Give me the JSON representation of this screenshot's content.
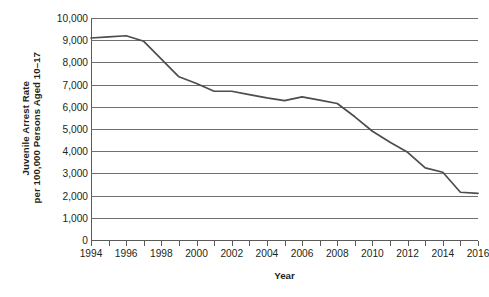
{
  "chart_data": {
    "type": "line",
    "title": "",
    "xlabel": "Year",
    "ylabel_line1": "Juvenile Arrest Rate",
    "ylabel_line2": "per 100,000 Persons Aged 10–17",
    "x": [
      1994,
      1995,
      1996,
      1997,
      1998,
      1999,
      2000,
      2001,
      2002,
      2003,
      2004,
      2005,
      2006,
      2007,
      2008,
      2009,
      2010,
      2011,
      2012,
      2013,
      2014,
      2015,
      2016
    ],
    "values": [
      9100,
      9150,
      9200,
      8950,
      8150,
      7350,
      7050,
      6700,
      6700,
      6550,
      6400,
      6280,
      6450,
      6300,
      6150,
      5550,
      4900,
      4400,
      3950,
      3250,
      3050,
      2150,
      2100
    ],
    "series": [
      {
        "name": "Juvenile Arrest Rate",
        "color": "#4d4d4d",
        "values": [
          9100,
          9150,
          9200,
          8950,
          8150,
          7350,
          7050,
          6700,
          6700,
          6550,
          6400,
          6280,
          6450,
          6300,
          6150,
          5550,
          4900,
          4400,
          3950,
          3250,
          3050,
          2150,
          2100
        ]
      }
    ],
    "xlim": [
      1994,
      2016
    ],
    "ylim": [
      0,
      10000
    ],
    "y_ticks": [
      0,
      1000,
      2000,
      3000,
      4000,
      5000,
      6000,
      7000,
      8000,
      9000,
      10000
    ],
    "y_tick_labels": [
      "0",
      "1,000",
      "2,000",
      "3,000",
      "4,000",
      "5,000",
      "6,000",
      "7,000",
      "8,000",
      "9,000",
      "10,000"
    ],
    "x_ticks": [
      1994,
      1995,
      1996,
      1997,
      1998,
      1999,
      2000,
      2001,
      2002,
      2003,
      2004,
      2005,
      2006,
      2007,
      2008,
      2009,
      2010,
      2011,
      2012,
      2013,
      2014,
      2015,
      2016
    ],
    "x_tick_labels_shown": [
      "1994",
      "1996",
      "1998",
      "2000",
      "2002",
      "2004",
      "2006",
      "2008",
      "2010",
      "2012",
      "2014",
      "2016"
    ],
    "grid": "horizontal",
    "legend": "none",
    "line_color": "#4d4d4d",
    "grid_color": "#6f6f6f",
    "axis_color": "#5a5a5a",
    "background": "#ffffff",
    "text_color": "#231f20"
  }
}
